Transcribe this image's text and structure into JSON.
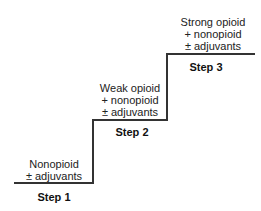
{
  "diagram": {
    "type": "staircase",
    "steps": [
      {
        "label": "Step 1",
        "lines": [
          "Nonopioid",
          "± adjuvants"
        ]
      },
      {
        "label": "Step 2",
        "lines": [
          "Weak opioid",
          "+ nonopioid",
          "± adjuvants"
        ]
      },
      {
        "label": "Step 3",
        "lines": [
          "Strong opioid",
          "+ nonopioid",
          "± adjuvants"
        ]
      }
    ],
    "colors": {
      "line": "#333333",
      "text": "#222222",
      "background": "#ffffff"
    }
  }
}
